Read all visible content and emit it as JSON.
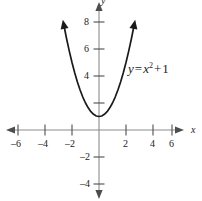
{
  "figure": {
    "equation_label": {
      "lhs": "y",
      "equals": "=",
      "base": "x",
      "exponent": "2",
      "plus": "+",
      "constant": "1"
    },
    "axis_names": {
      "x": "x",
      "y": "y"
    },
    "colors": {
      "curve": "#1a1a1a",
      "axis": "#8c8c8c",
      "text": "#222222",
      "background": "#ffffff"
    }
  },
  "chart_data": {
    "type": "line",
    "title": "",
    "subtitle": "",
    "xlabel": "x",
    "ylabel": "y",
    "grid": false,
    "legend": null,
    "xlim": [
      -7,
      6.5
    ],
    "ylim": [
      -5,
      9
    ],
    "xticks": [
      -6,
      -4,
      -2,
      2,
      4,
      6
    ],
    "xtick_labels": [
      "–6",
      "–4",
      "–2",
      "2",
      "4",
      "6"
    ],
    "yticks": [
      2,
      4,
      6,
      8,
      -2,
      -4
    ],
    "ytick_labels": [
      "",
      "4",
      "6",
      "8",
      "–2",
      "–4"
    ],
    "annotations": [
      {
        "text": "y = x² + 1",
        "x": 2.3,
        "y": 4.2
      }
    ],
    "series": [
      {
        "name": "y = x^2 + 1",
        "equation": "y = x^2 + 1",
        "vertex": [
          0,
          1
        ],
        "x": [
          -2.6,
          -2.4,
          -2.2,
          -2.0,
          -1.8,
          -1.6,
          -1.4,
          -1.2,
          -1.0,
          -0.8,
          -0.6,
          -0.4,
          -0.2,
          0,
          0.2,
          0.4,
          0.6,
          0.8,
          1.0,
          1.2,
          1.4,
          1.6,
          1.8,
          2.0,
          2.2,
          2.4,
          2.6
        ],
        "values": [
          7.76,
          6.76,
          5.84,
          5.0,
          4.24,
          3.56,
          2.96,
          2.44,
          2.0,
          1.64,
          1.36,
          1.16,
          1.04,
          1.0,
          1.04,
          1.16,
          1.36,
          1.64,
          2.0,
          2.44,
          2.96,
          3.56,
          4.24,
          5.0,
          5.84,
          6.76,
          7.76
        ]
      }
    ]
  }
}
